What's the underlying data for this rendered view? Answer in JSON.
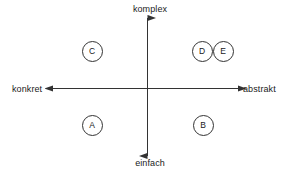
{
  "diagram": {
    "background_color": "#ffffff",
    "line_color": "#333333",
    "text_color": "#1a1a1a",
    "axes": {
      "vertical": {
        "top_label": "komplex",
        "bottom_label": "einfach",
        "arrow_both_ends": true
      },
      "horizontal": {
        "left_label": "konkret",
        "right_label": "abstrakt",
        "arrow_both_ends": true
      }
    },
    "nodes": [
      {
        "label": "A",
        "quadrant": "lower-left",
        "x": 92,
        "y": 125
      },
      {
        "label": "B",
        "quadrant": "lower-right",
        "x": 203,
        "y": 125
      },
      {
        "label": "C",
        "quadrant": "upper-left",
        "x": 92,
        "y": 51
      },
      {
        "label": "D",
        "quadrant": "upper-right",
        "x": 202,
        "y": 51
      },
      {
        "label": "E",
        "quadrant": "upper-right",
        "x": 223,
        "y": 51
      }
    ]
  }
}
